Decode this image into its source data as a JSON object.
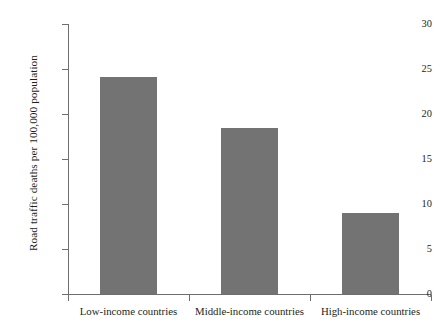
{
  "chart_data": {
    "type": "bar",
    "title": "",
    "subtitle": "",
    "xlabel": "",
    "ylabel": "Road traffic deaths per 100,000 population",
    "categories": [
      "Low-income countries",
      "Middle-income countries",
      "High-income countries"
    ],
    "values": [
      24.1,
      18.4,
      9.0
    ],
    "ylim": [
      0,
      30
    ],
    "yticks": [
      0,
      5,
      10,
      15,
      20,
      25,
      30
    ],
    "ytick_labels": [
      "0",
      "5",
      "10",
      "15",
      "20",
      "25",
      "30"
    ],
    "grid": false,
    "legend": false,
    "legend_position": "none",
    "bar_color": "#737373",
    "axis_color": "#6d6e71",
    "background_color": "#ffffff",
    "text_color": "#231f20"
  }
}
